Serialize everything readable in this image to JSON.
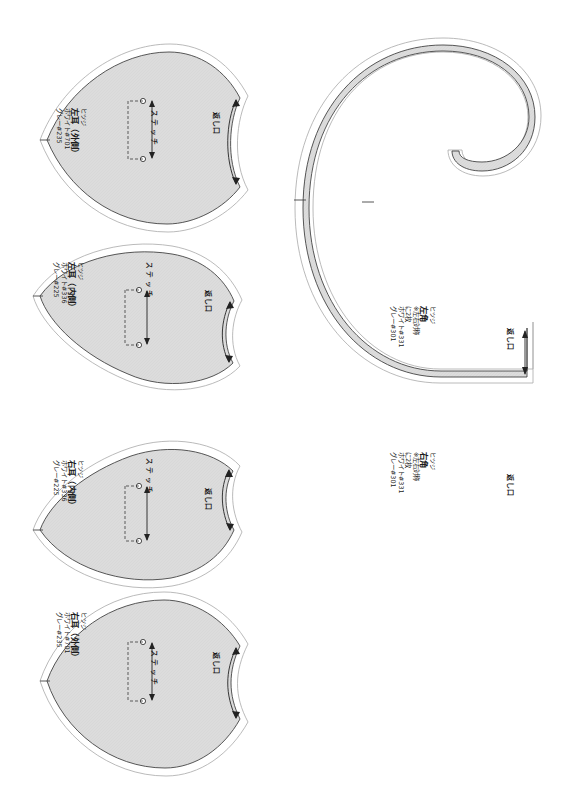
{
  "document": {
    "type": "sewing-pattern-sheet",
    "background_color": "#ffffff",
    "piece_fill": "#d9d9d9",
    "piece_stroke": "#3a3a3a",
    "seam_allowance_stroke": "#9a9a9a"
  },
  "common": {
    "stitch_label": "ステッチ",
    "opening_label": "返し口",
    "brand": "ヒツジ"
  },
  "pieces": [
    {
      "id": "left-ear-outer",
      "shape": "ear",
      "brand": "ヒツジ",
      "name": "左耳（外側）",
      "thread_white": "ホワイト#701",
      "thread_gray": "グレー#235",
      "stitch_label": "ステッチ",
      "opening_label": "返し口"
    },
    {
      "id": "left-ear-inner",
      "shape": "ear",
      "brand": "ヒツジ",
      "name": "左耳（内側）",
      "thread_white": "ホワイト#336",
      "thread_gray": "グレー#225",
      "stitch_label": "ステッチ",
      "opening_label": "返し口"
    },
    {
      "id": "right-ear-inner",
      "shape": "ear",
      "brand": "ヒツジ",
      "name": "右耳（内側）",
      "thread_white": "ホワイト#336",
      "thread_gray": "グレー#225",
      "stitch_label": "ステッチ",
      "opening_label": "返し口"
    },
    {
      "id": "right-ear-outer",
      "shape": "ear",
      "brand": "ヒツジ",
      "name": "右耳（外側）",
      "thread_white": "ホワイト#701",
      "thread_gray": "グレー#235",
      "stitch_label": "ステッチ",
      "opening_label": "返し口"
    },
    {
      "id": "left-horn",
      "shape": "horn",
      "brand": "ヒツジ",
      "name": "左角",
      "note_symmetry": "※左右対称",
      "note_count": "に2枚",
      "thread_white": "ホワイト#331",
      "thread_gray": "グレー#301",
      "opening_label": "返し口"
    },
    {
      "id": "right-horn",
      "shape": "horn",
      "brand": "ヒツジ",
      "name": "右角",
      "note_symmetry": "※左右対称",
      "note_count": "に2枚",
      "thread_white": "ホワイト#331",
      "thread_gray": "グレー#301",
      "opening_label": "返し口"
    }
  ]
}
